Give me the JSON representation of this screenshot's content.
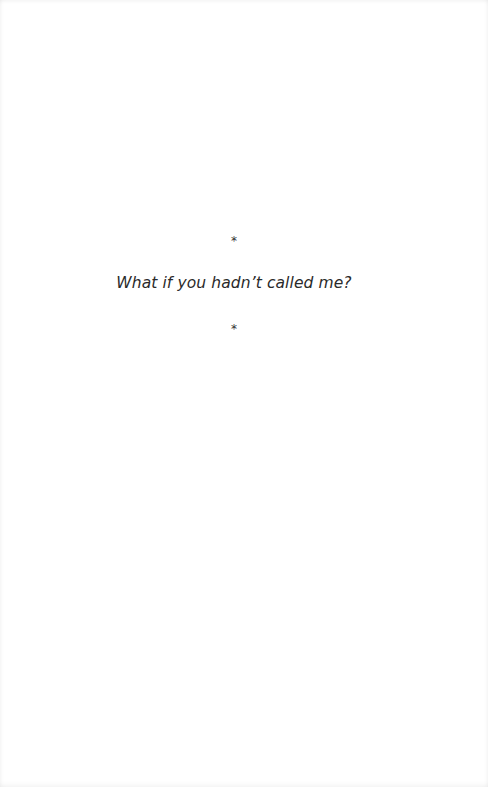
{
  "page": {
    "separator_top": "*",
    "line": "What if you hadn’t called me?",
    "separator_bottom": "*"
  }
}
